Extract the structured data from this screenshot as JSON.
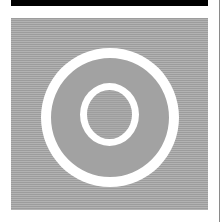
{
  "graphic": {
    "description": "Concentric white ring icon on horizontally striped gray background",
    "icon": "ring-target-icon",
    "colors": {
      "top_bar": "#000000",
      "background": "#ffffff",
      "stripe_dark": "#9c9c9c",
      "stripe_light": "#b2b2b2",
      "ring": "#ffffff",
      "ring_fill": "#a2a2a2",
      "side_rule": "#8a8a8a"
    }
  }
}
